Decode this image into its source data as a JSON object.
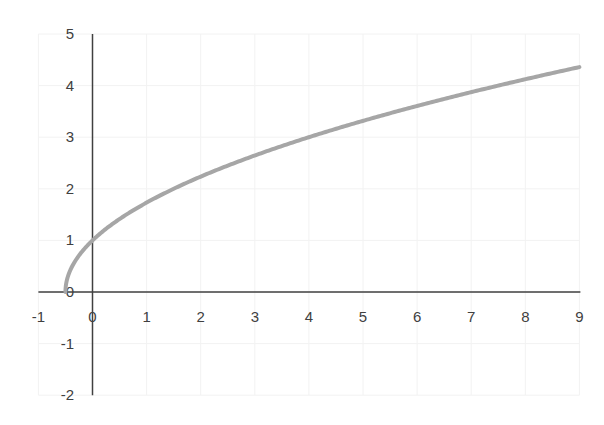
{
  "chart_data": {
    "type": "line",
    "title": "",
    "xlabel": "",
    "ylabel": "",
    "function": "y = sqrt(2x + 1)",
    "xlim": [
      -1,
      9
    ],
    "ylim": [
      -2,
      5
    ],
    "grid": true,
    "legend": null,
    "x_ticks": [
      "-1",
      "0",
      "1",
      "2",
      "3",
      "4",
      "5",
      "6",
      "7",
      "8",
      "9"
    ],
    "y_ticks": [
      "-2",
      "-1",
      "0",
      "1",
      "2",
      "3",
      "4",
      "5"
    ],
    "series": [
      {
        "name": "curve",
        "color": "#a6a6a6",
        "x": [
          -0.5,
          -0.4,
          -0.25,
          0,
          0.5,
          1,
          1.5,
          2,
          3,
          4,
          5,
          6,
          7,
          8,
          9
        ],
        "y": [
          0,
          0.447,
          0.707,
          1,
          1.414,
          1.732,
          2,
          2.236,
          2.646,
          3,
          3.317,
          3.606,
          3.873,
          4.123,
          4.359
        ]
      }
    ],
    "axis_color": "#404040",
    "grid_color": "#f2f2f2"
  }
}
